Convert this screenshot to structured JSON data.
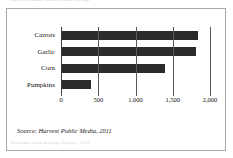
{
  "page": {
    "running_head": "Harvest Public Media report excerpt",
    "running_foot": "Nebraska farm acreage figures, 2011"
  },
  "figure": {
    "source_note": "Source: Harvest Public Media, 2011"
  },
  "chart_data": {
    "type": "bar",
    "orientation": "horizontal",
    "title": "",
    "subtitle": "",
    "xlabel": "",
    "ylabel": "",
    "categories": [
      "Carrots",
      "Garlic",
      "Corn",
      "Pumpkins"
    ],
    "values": [
      1840,
      1810,
      1400,
      400
    ],
    "series": [
      {
        "name": "Acres",
        "values": [
          1840,
          1810,
          1400,
          400
        ]
      }
    ],
    "xlim": [
      0,
      2000
    ],
    "xticks": [
      0,
      500,
      1000,
      1500,
      2000
    ],
    "xticklabels": [
      "0",
      "500",
      "1,000",
      "1,500",
      "2,000"
    ],
    "grid": true,
    "grid_axis": "x",
    "legend": false,
    "bar_color": "#2b2b2b",
    "axis_color": "#5a5a5a"
  }
}
